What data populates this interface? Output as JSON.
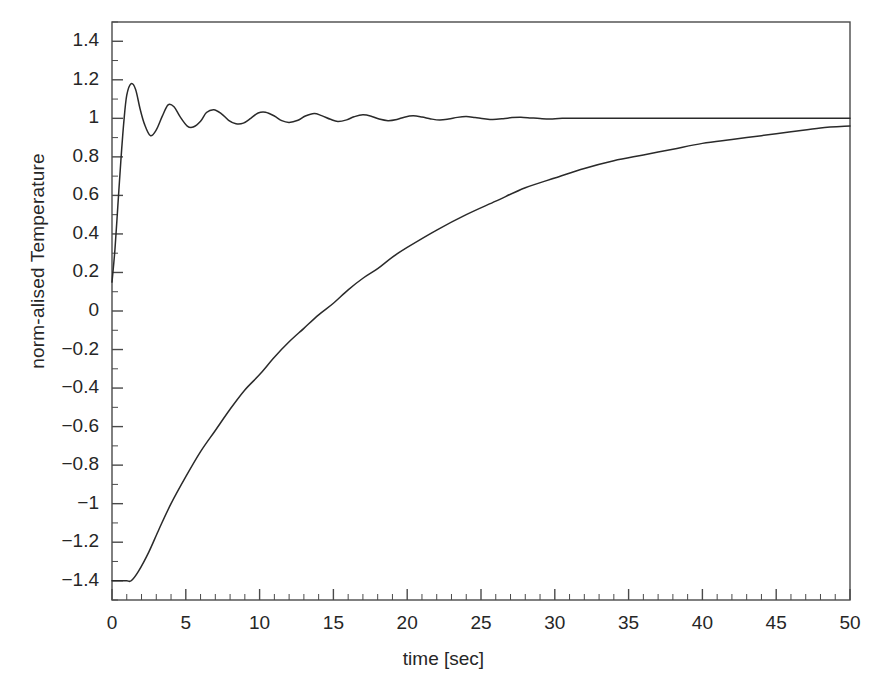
{
  "chart_data": {
    "type": "line",
    "title": "",
    "xlabel": "time [sec]",
    "ylabel": "norm-alised Temperature",
    "xlim": [
      0,
      50
    ],
    "ylim": [
      -1.5,
      1.5
    ],
    "grid": false,
    "legend": "none",
    "xticks": [
      0,
      5,
      10,
      15,
      20,
      25,
      30,
      35,
      40,
      45,
      50
    ],
    "xtick_labels": [
      "0",
      "5",
      "10",
      "15",
      "20",
      "25",
      "30",
      "35",
      "40",
      "45",
      "50"
    ],
    "x_minor_tick_step": 1,
    "yticks": [
      1.4,
      1.2,
      1,
      0.8,
      0.6,
      0.4,
      0.2,
      0,
      -0.2,
      -0.4,
      -0.6,
      -0.8,
      -1,
      -1.2,
      -1.4
    ],
    "ytick_labels": [
      "1.4",
      "1.2",
      "1",
      "0.8",
      "0.6",
      "0.4",
      "0.2",
      "0",
      "−0.2",
      "−0.4",
      "−0.6",
      "−0.8",
      "−1",
      "−1.2",
      "−1.4"
    ],
    "y_minor_tick_step": 0.1,
    "line_color": "#2a2a2a",
    "frame_color": "#4a4a4a",
    "series": [
      {
        "name": "damped oscillatory response",
        "description": "Underdamped step response rising steeply from 0.15 to an overshoot of 1.18 at t=1.3 s, oscillating with period ~2.5 s and decaying to a steady value of 1.0 by t~30 s.",
        "x": [
          0,
          0.2,
          0.4,
          0.6,
          0.8,
          1.0,
          1.3,
          1.6,
          1.9,
          2.2,
          2.6,
          3.0,
          3.4,
          3.8,
          4.2,
          4.6,
          5.1,
          5.5,
          6.0,
          6.4,
          6.9,
          7.4,
          7.9,
          8.4,
          8.9,
          9.4,
          9.9,
          10.4,
          11.0,
          11.5,
          12.0,
          12.6,
          13.1,
          13.7,
          14.2,
          14.8,
          15.3,
          15.9,
          16.4,
          17.0,
          17.6,
          18.1,
          18.7,
          19.3,
          19.8,
          20.4,
          21.0,
          21.6,
          22.2,
          22.8,
          23.4,
          24.0,
          24.6,
          25.2,
          25.8,
          26.5,
          27.1,
          27.7,
          28.4,
          29.0,
          29.7,
          30.5,
          32.0,
          35.0,
          40.0,
          45.0,
          50.0
        ],
        "y": [
          0.15,
          0.32,
          0.55,
          0.78,
          0.98,
          1.12,
          1.18,
          1.15,
          1.05,
          0.97,
          0.91,
          0.94,
          1.01,
          1.07,
          1.06,
          1.01,
          0.96,
          0.955,
          0.985,
          1.03,
          1.045,
          1.025,
          0.99,
          0.972,
          0.975,
          1.0,
          1.028,
          1.032,
          1.012,
          0.988,
          0.979,
          0.99,
          1.012,
          1.025,
          1.014,
          0.995,
          0.984,
          0.992,
          1.008,
          1.018,
          1.01,
          0.996,
          0.988,
          0.994,
          1.006,
          1.013,
          1.007,
          0.997,
          0.991,
          0.996,
          1.005,
          1.009,
          1.004,
          0.998,
          0.994,
          0.998,
          1.004,
          1.006,
          1.002,
          0.999,
          0.997,
          1.0,
          1.0,
          1.0,
          1.0,
          1.0,
          1.0
        ]
      },
      {
        "name": "slow exponential rise",
        "description": "Starts flat at -1.40 until t~1.3 s, then rises almost linearly and asymptotically approaches 1.0, reaching about 0.96 at t = 50 s.",
        "x": [
          0,
          0.5,
          1.0,
          1.3,
          1.8,
          2.5,
          3.2,
          4.0,
          5.0,
          6.0,
          7.0,
          8.0,
          9.0,
          10.0,
          11.0,
          12.0,
          13.0,
          14.0,
          15.0,
          16.0,
          17.0,
          18.0,
          19.0,
          20.0,
          22.0,
          24.0,
          26.0,
          28.0,
          30.0,
          32.0,
          34.0,
          36.0,
          38.0,
          40.0,
          42.0,
          44.0,
          46.0,
          48.0,
          50.0
        ],
        "y": [
          -1.4,
          -1.4,
          -1.4,
          -1.4,
          -1.35,
          -1.25,
          -1.13,
          -1.0,
          -0.86,
          -0.73,
          -0.62,
          -0.51,
          -0.41,
          -0.33,
          -0.24,
          -0.16,
          -0.09,
          -0.02,
          0.04,
          0.11,
          0.17,
          0.22,
          0.28,
          0.33,
          0.42,
          0.5,
          0.57,
          0.64,
          0.69,
          0.74,
          0.78,
          0.81,
          0.84,
          0.87,
          0.89,
          0.91,
          0.93,
          0.95,
          0.96
        ]
      }
    ]
  }
}
